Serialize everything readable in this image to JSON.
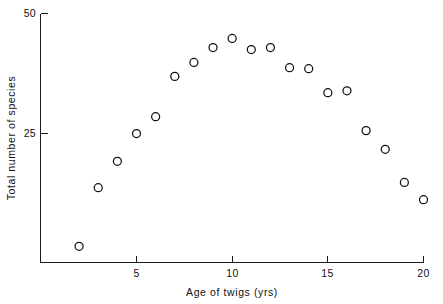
{
  "chart_data": {
    "type": "scatter",
    "title": "",
    "subtitle": "",
    "xlabel": "Age of twigs  (yrs)",
    "ylabel": "Total number of species",
    "xlim": [
      1.0,
      20.6
    ],
    "ylim": [
      0,
      50
    ],
    "grid": false,
    "legend": null,
    "x_ticks": [
      5,
      10,
      15,
      20
    ],
    "x_tick_labels": [
      "5",
      "10",
      "15",
      "20"
    ],
    "y_ticks": [
      25,
      50
    ],
    "y_tick_labels": [
      "25",
      "50"
    ],
    "marker": "open-circle",
    "marker_color": "#111111",
    "x": [
      2,
      3,
      4,
      5,
      6,
      7,
      8,
      9,
      10,
      11,
      12,
      13,
      14,
      15,
      16,
      17,
      18,
      19,
      20
    ],
    "values": [
      1.5,
      13.7,
      19.2,
      25.0,
      28.5,
      36.9,
      39.8,
      42.9,
      44.8,
      42.5,
      42.9,
      38.7,
      38.5,
      33.5,
      33.9,
      25.6,
      21.7,
      14.8,
      11.2
    ],
    "points": [
      {
        "x": 2,
        "y": 1.5
      },
      {
        "x": 3,
        "y": 13.7
      },
      {
        "x": 4,
        "y": 19.2
      },
      {
        "x": 5,
        "y": 25.0
      },
      {
        "x": 6,
        "y": 28.5
      },
      {
        "x": 7,
        "y": 36.9
      },
      {
        "x": 8,
        "y": 39.8
      },
      {
        "x": 9,
        "y": 42.9
      },
      {
        "x": 10,
        "y": 44.8
      },
      {
        "x": 11,
        "y": 42.5
      },
      {
        "x": 12,
        "y": 42.9
      },
      {
        "x": 13,
        "y": 38.7
      },
      {
        "x": 14,
        "y": 38.5
      },
      {
        "x": 15,
        "y": 33.5
      },
      {
        "x": 16,
        "y": 33.9
      },
      {
        "x": 17,
        "y": 25.6
      },
      {
        "x": 18,
        "y": 21.7
      },
      {
        "x": 19,
        "y": 14.8
      },
      {
        "x": 20,
        "y": 11.2
      }
    ]
  },
  "axes": {
    "x_axis_label": "Age of twigs  (yrs)",
    "y_axis_label": "Total number of species",
    "x_tick_labels": [
      "5",
      "10",
      "15",
      "20"
    ],
    "y_tick_labels": [
      "50",
      "25"
    ]
  },
  "style": {
    "background": "#ffffff",
    "ink": "#111111",
    "marker_radius_px": 4
  }
}
